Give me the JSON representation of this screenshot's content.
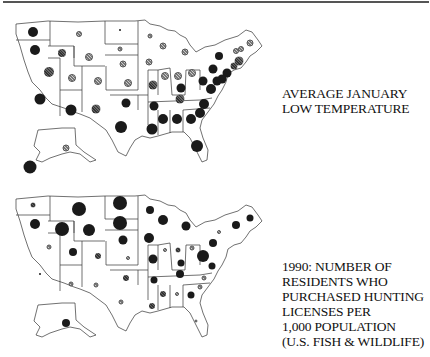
{
  "chart_data": [
    {
      "type": "proportional-symbol-map",
      "title": "AVERAGE JANUARY LOW TEMPERATURE",
      "title_lines": [
        "AVERAGE JANUARY",
        "LOW TEMPERATURE"
      ],
      "region": "United States (50 states)",
      "encoding": "circle size and darkness by state",
      "symbols": [
        {
          "state": "WA",
          "x": 33,
          "y": 32,
          "r": 5,
          "tone": "dark"
        },
        {
          "state": "OR",
          "x": 35,
          "y": 50,
          "r": 5,
          "tone": "dark"
        },
        {
          "state": "ID",
          "x": 62,
          "y": 53,
          "r": 4,
          "tone": "mid"
        },
        {
          "state": "MT",
          "x": 79,
          "y": 34,
          "r": 3,
          "tone": "light"
        },
        {
          "state": "WY",
          "x": 89,
          "y": 57,
          "r": 4,
          "tone": "light"
        },
        {
          "state": "ND",
          "x": 120,
          "y": 30,
          "r": 1,
          "tone": "dark"
        },
        {
          "state": "SD",
          "x": 120,
          "y": 49,
          "r": 2.5,
          "tone": "light"
        },
        {
          "state": "NE",
          "x": 123,
          "y": 64,
          "r": 3.5,
          "tone": "light"
        },
        {
          "state": "NV",
          "x": 49,
          "y": 72,
          "r": 5,
          "tone": "mid"
        },
        {
          "state": "UT",
          "x": 72,
          "y": 78,
          "r": 4,
          "tone": "light"
        },
        {
          "state": "CO",
          "x": 98,
          "y": 81,
          "r": 4,
          "tone": "light"
        },
        {
          "state": "KS",
          "x": 128,
          "y": 83,
          "r": 4,
          "tone": "light"
        },
        {
          "state": "CA",
          "x": 40,
          "y": 99,
          "r": 5.5,
          "tone": "dark"
        },
        {
          "state": "AZ",
          "x": 71,
          "y": 110,
          "r": 5.5,
          "tone": "dark"
        },
        {
          "state": "NM",
          "x": 96,
          "y": 109,
          "r": 4.5,
          "tone": "mid"
        },
        {
          "state": "OK",
          "x": 126,
          "y": 103,
          "r": 4.5,
          "tone": "dark"
        },
        {
          "state": "TX",
          "x": 121,
          "y": 127,
          "r": 6,
          "tone": "dark"
        },
        {
          "state": "MN",
          "x": 150,
          "y": 36,
          "r": 2.5,
          "tone": "light"
        },
        {
          "state": "WI",
          "x": 163,
          "y": 46,
          "r": 3.5,
          "tone": "light"
        },
        {
          "state": "MI",
          "x": 185,
          "y": 52,
          "r": 3.5,
          "tone": "light"
        },
        {
          "state": "IA",
          "x": 149,
          "y": 62,
          "r": 3.5,
          "tone": "light"
        },
        {
          "state": "IL",
          "x": 165,
          "y": 76,
          "r": 4,
          "tone": "light"
        },
        {
          "state": "MO",
          "x": 153,
          "y": 85,
          "r": 4.5,
          "tone": "mid"
        },
        {
          "state": "IN",
          "x": 178,
          "y": 76,
          "r": 4,
          "tone": "light"
        },
        {
          "state": "OH",
          "x": 192,
          "y": 73,
          "r": 4,
          "tone": "light"
        },
        {
          "state": "KY",
          "x": 181,
          "y": 88,
          "r": 4.5,
          "tone": "dark"
        },
        {
          "state": "TN",
          "x": 180,
          "y": 99,
          "r": 4.5,
          "tone": "mid"
        },
        {
          "state": "AR",
          "x": 154,
          "y": 106,
          "r": 4.5,
          "tone": "dark"
        },
        {
          "state": "LA",
          "x": 152,
          "y": 129,
          "r": 5.5,
          "tone": "dark"
        },
        {
          "state": "MS",
          "x": 163,
          "y": 119,
          "r": 5,
          "tone": "dark"
        },
        {
          "state": "AL",
          "x": 177,
          "y": 119,
          "r": 5,
          "tone": "dark"
        },
        {
          "state": "GA",
          "x": 191,
          "y": 119,
          "r": 5,
          "tone": "dark"
        },
        {
          "state": "FL",
          "x": 197,
          "y": 146,
          "r": 6,
          "tone": "dark"
        },
        {
          "state": "SC",
          "x": 200,
          "y": 113,
          "r": 5,
          "tone": "dark"
        },
        {
          "state": "NC",
          "x": 204,
          "y": 104,
          "r": 5,
          "tone": "dark"
        },
        {
          "state": "VA",
          "x": 211,
          "y": 89,
          "r": 5,
          "tone": "dark"
        },
        {
          "state": "WV",
          "x": 203,
          "y": 81,
          "r": 4.5,
          "tone": "dark"
        },
        {
          "state": "PA",
          "x": 213,
          "y": 69,
          "r": 4.5,
          "tone": "dark"
        },
        {
          "state": "NY",
          "x": 219,
          "y": 56,
          "r": 4,
          "tone": "dark"
        },
        {
          "state": "VT",
          "x": 236,
          "y": 51,
          "r": 3,
          "tone": "light"
        },
        {
          "state": "NH",
          "x": 241,
          "y": 49,
          "r": 3,
          "tone": "light"
        },
        {
          "state": "ME",
          "x": 250,
          "y": 43,
          "r": 3.5,
          "tone": "light"
        },
        {
          "state": "MA",
          "x": 239,
          "y": 61,
          "r": 4.5,
          "tone": "mid"
        },
        {
          "state": "CT",
          "x": 234,
          "y": 66,
          "r": 3.5,
          "tone": "mid"
        },
        {
          "state": "NJ",
          "x": 227,
          "y": 73,
          "r": 4.5,
          "tone": "dark"
        },
        {
          "state": "DE",
          "x": 222,
          "y": 79,
          "r": 4.5,
          "tone": "dark"
        },
        {
          "state": "MD",
          "x": 217,
          "y": 81,
          "r": 4.5,
          "tone": "dark"
        },
        {
          "state": "AK",
          "x": 66,
          "y": 148,
          "r": 3.5,
          "tone": "light"
        },
        {
          "state": "HI",
          "x": 30,
          "y": 167,
          "r": 6.5,
          "tone": "dark"
        }
      ]
    },
    {
      "type": "proportional-symbol-map",
      "title": "1990: NUMBER OF RESIDENTS WHO PURCHASED HUNTING LICENSES PER 1,000 POPULATION (U.S. FISH & WILDLIFE)",
      "title_lines": [
        "1990: NUMBER OF",
        "RESIDENTS WHO",
        "PURCHASED HUNTING",
        "LICENSES PER",
        "1,000 POPULATION",
        "(U.S. FISH & WILDLIFE)"
      ],
      "region": "United States (50 states)",
      "encoding": "circle size and darkness by state",
      "symbols": [
        {
          "state": "WA",
          "x": 33,
          "y": 205,
          "r": 2.5,
          "tone": "mid"
        },
        {
          "state": "OR",
          "x": 35,
          "y": 224,
          "r": 5,
          "tone": "dark"
        },
        {
          "state": "ID",
          "x": 62,
          "y": 229,
          "r": 7,
          "tone": "dark"
        },
        {
          "state": "MT",
          "x": 79,
          "y": 209,
          "r": 7,
          "tone": "dark"
        },
        {
          "state": "WY",
          "x": 89,
          "y": 230,
          "r": 6,
          "tone": "dark"
        },
        {
          "state": "ND",
          "x": 120,
          "y": 203,
          "r": 7,
          "tone": "dark"
        },
        {
          "state": "SD",
          "x": 120,
          "y": 223,
          "r": 7,
          "tone": "dark"
        },
        {
          "state": "NE",
          "x": 123,
          "y": 240,
          "r": 4.5,
          "tone": "dark"
        },
        {
          "state": "NV",
          "x": 49,
          "y": 247,
          "r": 2.5,
          "tone": "light"
        },
        {
          "state": "UT",
          "x": 73,
          "y": 252,
          "r": 4,
          "tone": "dark"
        },
        {
          "state": "CO",
          "x": 98,
          "y": 256,
          "r": 3,
          "tone": "mid"
        },
        {
          "state": "KS",
          "x": 128,
          "y": 258,
          "r": 2,
          "tone": "light"
        },
        {
          "state": "CA",
          "x": 40,
          "y": 274,
          "r": 1,
          "tone": "dark"
        },
        {
          "state": "AZ",
          "x": 71,
          "y": 284,
          "r": 2.5,
          "tone": "light"
        },
        {
          "state": "NM",
          "x": 96,
          "y": 285,
          "r": 2.5,
          "tone": "light"
        },
        {
          "state": "OK",
          "x": 126,
          "y": 278,
          "r": 3,
          "tone": "mid"
        },
        {
          "state": "TX",
          "x": 121,
          "y": 302,
          "r": 2.5,
          "tone": "light"
        },
        {
          "state": "MN",
          "x": 150,
          "y": 210,
          "r": 4,
          "tone": "dark"
        },
        {
          "state": "WI",
          "x": 163,
          "y": 220,
          "r": 5,
          "tone": "dark"
        },
        {
          "state": "MI",
          "x": 186,
          "y": 226,
          "r": 4.5,
          "tone": "dark"
        },
        {
          "state": "IA",
          "x": 149,
          "y": 238,
          "r": 5,
          "tone": "dark"
        },
        {
          "state": "IL",
          "x": 165,
          "y": 250,
          "r": 2,
          "tone": "light"
        },
        {
          "state": "MO",
          "x": 153,
          "y": 259,
          "r": 4.5,
          "tone": "dark"
        },
        {
          "state": "IN",
          "x": 178,
          "y": 250,
          "r": 2.5,
          "tone": "mid"
        },
        {
          "state": "OH",
          "x": 192,
          "y": 248,
          "r": 2.5,
          "tone": "light"
        },
        {
          "state": "KY",
          "x": 181,
          "y": 263,
          "r": 3.5,
          "tone": "dark"
        },
        {
          "state": "WV",
          "x": 203,
          "y": 256,
          "r": 6,
          "tone": "dark"
        },
        {
          "state": "VA",
          "x": 212,
          "y": 266,
          "r": 3.5,
          "tone": "dark"
        },
        {
          "state": "TN",
          "x": 180,
          "y": 274,
          "r": 4,
          "tone": "dark"
        },
        {
          "state": "AR",
          "x": 154,
          "y": 280,
          "r": 3.5,
          "tone": "dark"
        },
        {
          "state": "NC",
          "x": 204,
          "y": 278,
          "r": 2.5,
          "tone": "light"
        },
        {
          "state": "SC",
          "x": 200,
          "y": 287,
          "r": 2.5,
          "tone": "light"
        },
        {
          "state": "GA",
          "x": 191,
          "y": 295,
          "r": 3.5,
          "tone": "dark"
        },
        {
          "state": "AL",
          "x": 177,
          "y": 294,
          "r": 2,
          "tone": "light"
        },
        {
          "state": "MS",
          "x": 163,
          "y": 294,
          "r": 3,
          "tone": "mid"
        },
        {
          "state": "LA",
          "x": 152,
          "y": 306,
          "r": 3,
          "tone": "mid"
        },
        {
          "state": "FL",
          "x": 196,
          "y": 321,
          "r": 1.5,
          "tone": "light"
        },
        {
          "state": "PA",
          "x": 213,
          "y": 243,
          "r": 4,
          "tone": "dark"
        },
        {
          "state": "NY",
          "x": 219,
          "y": 232,
          "r": 2,
          "tone": "light"
        },
        {
          "state": "VT",
          "x": 236,
          "y": 225,
          "r": 4,
          "tone": "dark"
        },
        {
          "state": "ME",
          "x": 250,
          "y": 218,
          "r": 3.5,
          "tone": "dark"
        },
        {
          "state": "AK",
          "x": 66,
          "y": 323,
          "r": 4,
          "tone": "dark"
        }
      ]
    }
  ],
  "labels": {
    "top": [
      "AVERAGE JANUARY",
      "LOW TEMPERATURE"
    ],
    "bottom": [
      "1990: NUMBER OF",
      "RESIDENTS WHO",
      "PURCHASED HUNTING",
      "LICENSES PER",
      "1,000 POPULATION",
      "(U.S. FISH & WILDLIFE)"
    ]
  },
  "colors": {
    "dark": "#1a1a1a",
    "mid": "#444444",
    "light": "#999999",
    "outline": "#333333",
    "rule": "#555555"
  }
}
